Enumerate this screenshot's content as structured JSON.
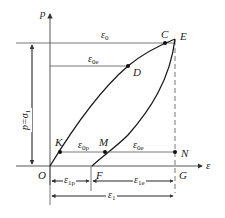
{
  "diagram": {
    "axes": {
      "y_label": "p",
      "x_label": "ε",
      "origin_label": "O"
    },
    "points": {
      "C": "C",
      "E": "E",
      "D": "D",
      "K": "K",
      "M": "M",
      "N": "N",
      "F": "F",
      "G": "G"
    },
    "strain_labels": {
      "eps0": {
        "main": "ε",
        "sub": "0"
      },
      "eps0e_top": {
        "main": "ε",
        "sub": "0e"
      },
      "eps0p": {
        "main": "ε",
        "sub": "0p"
      },
      "eps0e_bottom": {
        "main": "ε",
        "sub": "0e"
      },
      "eps1p": {
        "main": "ε",
        "sub": "1p"
      },
      "eps1e": {
        "main": "ε",
        "sub": "1e"
      },
      "eps1": {
        "main": "ε",
        "sub": "1"
      }
    },
    "pressure_label": {
      "main": "p=σ",
      "sub": "1"
    },
    "colors": {
      "line": "#333333",
      "curve": "#1a1a1a",
      "background": "#ffffff"
    }
  }
}
